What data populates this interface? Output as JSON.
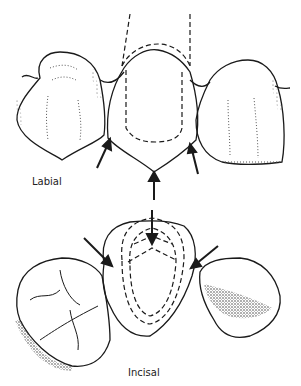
{
  "labels": {
    "top_view": "Labial",
    "bottom_view": "Incisal"
  },
  "colors": {
    "ink": "#1a1a1a",
    "background": "#ffffff"
  }
}
